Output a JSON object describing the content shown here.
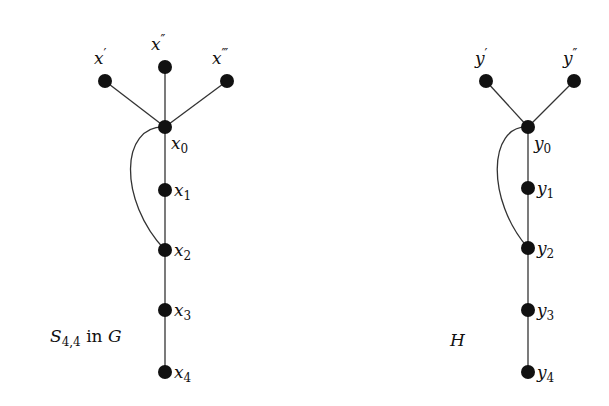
{
  "graphs": [
    {
      "name": "S44-in-G",
      "caption": {
        "main": "S",
        "sub": "4,4",
        "rest": " in ",
        "tail": "G"
      },
      "center": {
        "label": "x",
        "sub": "0"
      },
      "leaves": [
        {
          "label": "x",
          "prime": "′"
        },
        {
          "label": "x",
          "prime": "″"
        },
        {
          "label": "x",
          "prime": "‴"
        }
      ],
      "path": [
        {
          "label": "x",
          "sub": "1"
        },
        {
          "label": "x",
          "sub": "2"
        },
        {
          "label": "x",
          "sub": "3"
        },
        {
          "label": "x",
          "sub": "4"
        }
      ],
      "extra_edge": "x0-x2 (curved)"
    },
    {
      "name": "H",
      "caption": {
        "main": "H"
      },
      "center": {
        "label": "y",
        "sub": "0"
      },
      "leaves": [
        {
          "label": "y",
          "prime": "′"
        },
        {
          "label": "y",
          "prime": "″"
        }
      ],
      "path": [
        {
          "label": "y",
          "sub": "1"
        },
        {
          "label": "y",
          "sub": "2"
        },
        {
          "label": "y",
          "sub": "3"
        },
        {
          "label": "y",
          "sub": "4"
        }
      ],
      "extra_edge": "y0-y2 (curved)"
    }
  ],
  "colors": {
    "node": "#111111",
    "edge": "#333333",
    "background": "#ffffff"
  }
}
